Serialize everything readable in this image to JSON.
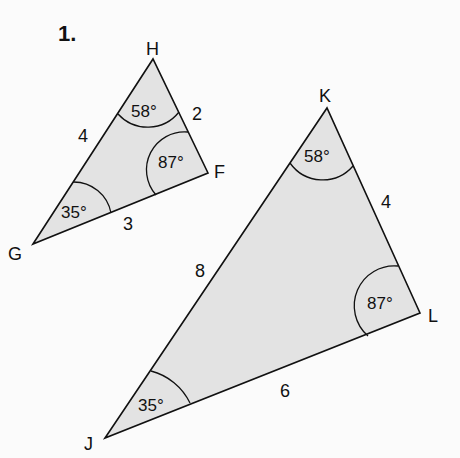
{
  "problem_number": "1.",
  "triangles": [
    {
      "name": "triangle-GHF",
      "vertices": {
        "G": "G",
        "H": "H",
        "F": "F"
      },
      "angles": {
        "H": "58°",
        "F": "87°",
        "G": "35°"
      },
      "sides": {
        "GH": "4",
        "HF": "2",
        "GF": "3"
      }
    },
    {
      "name": "triangle-JKL",
      "vertices": {
        "J": "J",
        "K": "K",
        "L": "L"
      },
      "angles": {
        "K": "58°",
        "L": "87°",
        "J": "35°"
      },
      "sides": {
        "JK": "8",
        "KL": "4",
        "JL": "6"
      }
    }
  ],
  "colors": {
    "fill": "#e3e3e3",
    "stroke": "#111111",
    "background": "#fbfbfb"
  }
}
